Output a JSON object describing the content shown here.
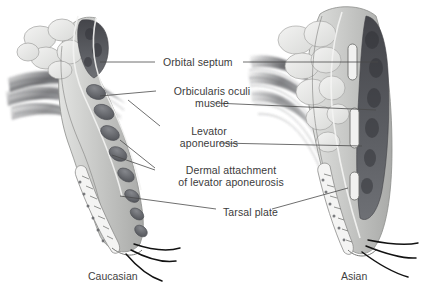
{
  "figure": {
    "type": "anatomical-illustration",
    "comparison": "Caucasian versus Asian upper eyelid anatomy",
    "background_color": "#ffffff",
    "text_color": "#3b3b3b",
    "leader_line_color": "#4a4a4a"
  },
  "labels": [
    {
      "id": "orbital-septum",
      "line1": "Orbital septum",
      "line2": ""
    },
    {
      "id": "orbicularis-oculi-muscle",
      "line1": "Orbicularis oculi",
      "line2": "muscle"
    },
    {
      "id": "levator-aponeurosis",
      "line1": "Levator",
      "line2": "aponeurosis"
    },
    {
      "id": "dermal-attachment",
      "line1": "Dermal attachment",
      "line2": "of levator aponeurosis"
    },
    {
      "id": "tarsal-plate",
      "line1": "Tarsal plate",
      "line2": ""
    }
  ],
  "captions": {
    "left": "Caucasian",
    "right": "Asian"
  },
  "palette": {
    "fat_lobule_light": "#e8e8e6",
    "fat_lobule_outline": "#9a9a98",
    "orbital_fat_dark": "#55565a",
    "muscle_bundle": "#6f7176",
    "tissue_mid": "#b9bab8",
    "tissue_pale": "#d8d9d7",
    "skin_outline": "#8d8e8c",
    "eyelash": "#121212",
    "tarsus_fill": "#f2f2f1"
  }
}
